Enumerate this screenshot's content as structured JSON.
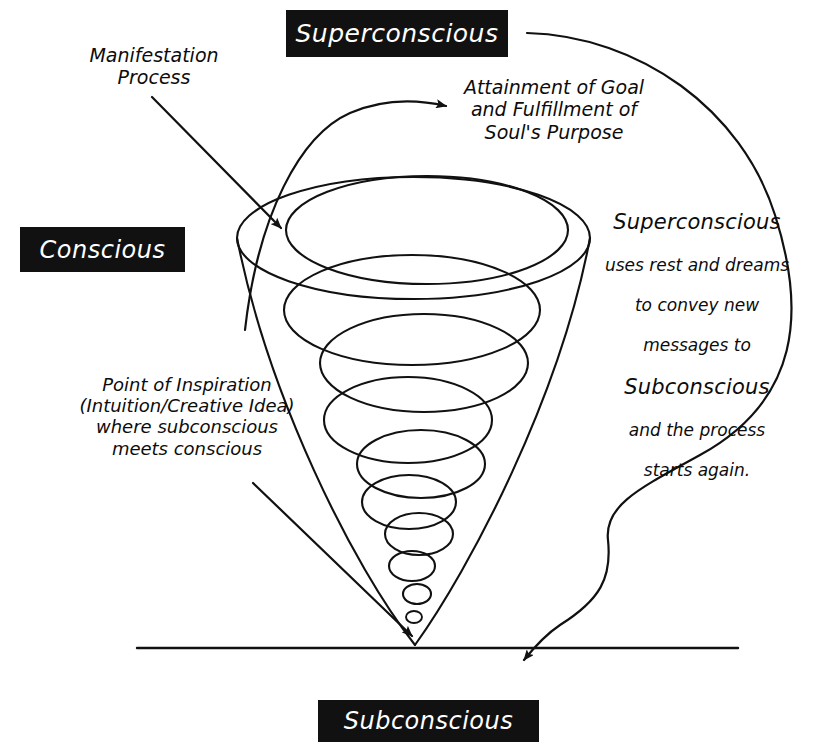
{
  "diagram": {
    "background_color": "#ffffff",
    "ink_color": "#111111",
    "label_box_bg": "#111111",
    "label_box_text_color": "#ffffff"
  },
  "labels": {
    "superconscious": "Superconscious",
    "conscious": "Conscious",
    "subconscious": "Subconscious"
  },
  "annotations": {
    "manifestation": "Manifestation\nProcess",
    "attainment": "Attainment of Goal\nand Fulfillment of\nSoul's Purpose",
    "inspiration": "Point of Inspiration\n(Intuition/Creative Idea)\nwhere subconscious\nmeets conscious",
    "cycle": {
      "line1": "Superconscious",
      "line2": "uses rest and dreams",
      "line3": "to convey new",
      "line4": "messages to",
      "line5": "Subconscious",
      "line6": "and the process",
      "line7": "starts again."
    }
  },
  "graphics": {
    "cone_apex": "415,645",
    "cone_top_left": "237,237",
    "cone_top_right": "590,240",
    "ground_line": "137,648 to 738,648",
    "spiral_rings": 9,
    "arrow_manifestation": "152,97 to 285,232",
    "arrow_attainment": "curve to 452,106",
    "arrow_inspiration": "253,483 to 418,640",
    "arrow_cycle_return": "525,33 around right to 520,664"
  }
}
